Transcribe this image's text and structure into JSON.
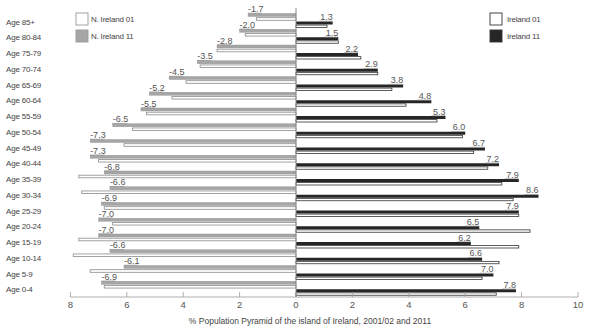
{
  "chart_data": {
    "type": "bar",
    "subtype": "population-pyramid",
    "title": "",
    "xlabel": "% Population Pyramid of the island of Ireland, 2001/02 and 2011",
    "ylabel": "",
    "xlim": [
      -8,
      10
    ],
    "x_ticks": [
      -8,
      -6,
      -4,
      -2,
      0,
      2,
      4,
      6,
      8,
      10
    ],
    "x_tick_labels": [
      "8",
      "6",
      "4",
      "2",
      "0",
      "2",
      "4",
      "6",
      "8",
      "10"
    ],
    "grid": false,
    "categories": [
      "Age 85+",
      "Age 80-84",
      "Age 75-79",
      "Age 70-74",
      "Age 65-69",
      "Age 60-64",
      "Age 55-59",
      "Age 50-54",
      "Age 45-49",
      "Age 40-44",
      "Age 35-39",
      "Age 30-34",
      "Age 25-29",
      "Age 20-24",
      "Age 15-19",
      "Age 10-14",
      "Age 5-9",
      "Age 0-4"
    ],
    "series": [
      {
        "name": "N. Ireland 11",
        "side": "left",
        "color": "#a6a6a6",
        "labeled": true,
        "values": [
          -1.7,
          -2.0,
          -2.8,
          -3.5,
          -4.5,
          -5.2,
          -5.5,
          -6.5,
          -7.3,
          -7.3,
          -6.8,
          -6.6,
          -6.9,
          -7.0,
          -7.0,
          -6.6,
          -6.1,
          -6.9
        ]
      },
      {
        "name": "N. Ireland 01",
        "side": "left",
        "color": "#ffffff",
        "labeled": false,
        "values": [
          -1.4,
          -1.8,
          -2.8,
          -3.4,
          -3.9,
          -4.4,
          -5.3,
          -5.8,
          -6.1,
          -7.0,
          -7.7,
          -7.6,
          -6.8,
          -6.5,
          -7.7,
          -7.9,
          -7.3,
          -6.8
        ]
      },
      {
        "name": "Ireland 11",
        "side": "right",
        "color": "#262626",
        "labeled": true,
        "values": [
          1.3,
          1.5,
          2.2,
          2.9,
          3.8,
          4.8,
          5.3,
          6.0,
          6.7,
          7.2,
          7.9,
          8.6,
          7.9,
          6.5,
          6.2,
          6.6,
          7.0,
          7.8
        ]
      },
      {
        "name": "Ireland 01",
        "side": "right",
        "color": "#ffffff",
        "labeled": false,
        "values": [
          1.1,
          1.5,
          2.3,
          2.9,
          3.4,
          3.9,
          5.0,
          5.9,
          6.3,
          6.8,
          7.3,
          7.7,
          7.9,
          8.3,
          7.9,
          7.2,
          6.6,
          7.1
        ]
      }
    ],
    "legend": {
      "left": [
        {
          "label": "N. Ireland 01",
          "color": "#ffffff"
        },
        {
          "label": "N. Ireland 11",
          "color": "#a6a6a6"
        }
      ],
      "right": [
        {
          "label": "Ireland 01",
          "color": "#ffffff"
        },
        {
          "label": "Ireland 11",
          "color": "#262626"
        }
      ],
      "position": "top-left and top-right"
    }
  }
}
